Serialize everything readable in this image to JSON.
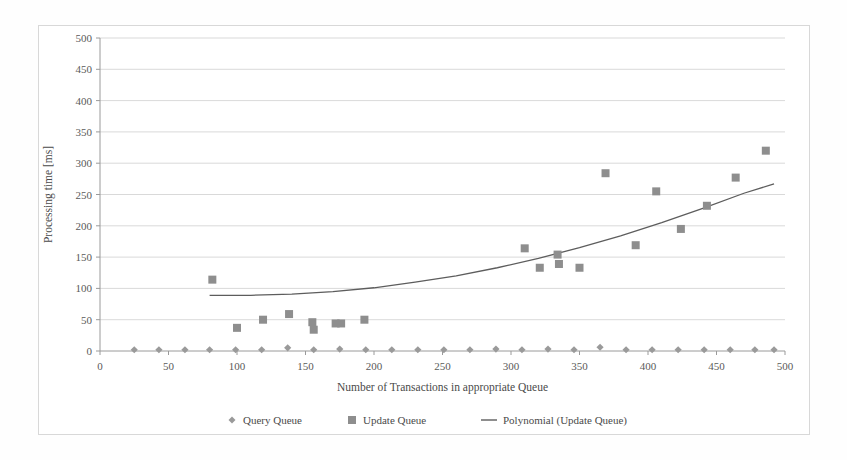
{
  "chart_data": {
    "type": "scatter",
    "title": "",
    "xlabel": "Number of Transactions in appropriate Queue",
    "ylabel": "Processing time [ms]",
    "xlim": [
      0,
      500
    ],
    "ylim": [
      0,
      500
    ],
    "xticks": [
      0,
      50,
      100,
      150,
      200,
      250,
      300,
      350,
      400,
      450,
      500
    ],
    "yticks": [
      0,
      50,
      100,
      150,
      200,
      250,
      300,
      350,
      400,
      450,
      500
    ],
    "grid": "horizontal",
    "legend_position": "bottom",
    "series": [
      {
        "name": "Query Queue",
        "marker": "diamond",
        "color": "#9a9a9a",
        "points": [
          [
            25,
            2
          ],
          [
            43,
            2
          ],
          [
            62,
            2
          ],
          [
            80,
            2
          ],
          [
            99,
            2
          ],
          [
            118,
            2
          ],
          [
            137,
            5
          ],
          [
            156,
            2
          ],
          [
            175,
            3
          ],
          [
            194,
            2
          ],
          [
            213,
            2
          ],
          [
            232,
            2
          ],
          [
            251,
            2
          ],
          [
            270,
            2
          ],
          [
            289,
            3
          ],
          [
            308,
            2
          ],
          [
            327,
            3
          ],
          [
            346,
            2
          ],
          [
            365,
            6
          ],
          [
            384,
            2
          ],
          [
            403,
            2
          ],
          [
            422,
            2
          ],
          [
            441,
            2
          ],
          [
            460,
            2
          ],
          [
            478,
            2
          ],
          [
            492,
            2
          ]
        ]
      },
      {
        "name": "Update Queue",
        "marker": "square",
        "color": "#8e8e8e",
        "points": [
          [
            82,
            114
          ],
          [
            100,
            37
          ],
          [
            119,
            50
          ],
          [
            138,
            59
          ],
          [
            155,
            46
          ],
          [
            156,
            34
          ],
          [
            172,
            44
          ],
          [
            176,
            44
          ],
          [
            193,
            50
          ],
          [
            310,
            164
          ],
          [
            321,
            133
          ],
          [
            334,
            154
          ],
          [
            335,
            139
          ],
          [
            350,
            133
          ],
          [
            369,
            284
          ],
          [
            391,
            169
          ],
          [
            406,
            255
          ],
          [
            424,
            195
          ],
          [
            443,
            232
          ],
          [
            464,
            277
          ],
          [
            486,
            320
          ]
        ]
      }
    ],
    "trendline": {
      "name": "Polynomial (Update Queue)",
      "color": "#5d5d5d",
      "points": [
        [
          80,
          89
        ],
        [
          110,
          89
        ],
        [
          140,
          91
        ],
        [
          170,
          95
        ],
        [
          200,
          101
        ],
        [
          230,
          110
        ],
        [
          260,
          120
        ],
        [
          290,
          133
        ],
        [
          320,
          148
        ],
        [
          350,
          165
        ],
        [
          380,
          184
        ],
        [
          410,
          205
        ],
        [
          440,
          228
        ],
        [
          470,
          252
        ],
        [
          492,
          267
        ]
      ]
    },
    "legend": [
      {
        "label": "Query Queue",
        "marker": "diamond"
      },
      {
        "label": "Update Queue",
        "marker": "square"
      },
      {
        "label": "Polynomial (Update Queue)",
        "marker": "line"
      }
    ]
  },
  "geometry": {
    "plot_left": 100,
    "plot_right": 785,
    "plot_top": 38,
    "plot_bottom": 351
  }
}
